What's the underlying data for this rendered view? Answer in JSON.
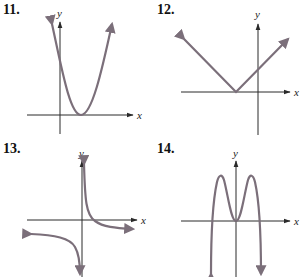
{
  "colors": {
    "curve": "#7b6f7a",
    "axis": "#2a2a2a"
  },
  "graphs": [
    {
      "number": "11.",
      "x_label": "x",
      "y_label": "y",
      "shape": "upward-parabola",
      "description": "Parabola opening up with vertex on the positive x-axis"
    },
    {
      "number": "12.",
      "x_label": "x",
      "y_label": "y",
      "shape": "absolute-value-v",
      "description": "V-shaped graph with vertex on the negative x-axis"
    },
    {
      "number": "13.",
      "x_label": "x",
      "y_label": "y",
      "shape": "hyperbola-reciprocal",
      "description": "Two-branch rational curve with vertical asymptote at y-axis and horizontal asymptote below x-axis"
    },
    {
      "number": "14.",
      "x_label": "x",
      "y_label": "y",
      "shape": "quartic-m",
      "description": "M-shaped quartic with two maxima and a local minimum at the origin"
    }
  ]
}
